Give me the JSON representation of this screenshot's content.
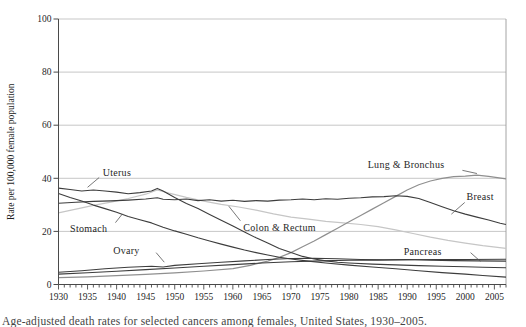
{
  "figure": {
    "caption": "Age-adjusted death rates for selected cancers among females, United States, 1930–2005.",
    "background": "#ffffff"
  },
  "chart_data": {
    "type": "line",
    "title": "",
    "xlabel": "",
    "ylabel": "Rate per 100,000 female population",
    "xlim": [
      1930,
      2007
    ],
    "ylim": [
      0,
      100
    ],
    "x_major_ticks": [
      1930,
      1935,
      1940,
      1945,
      1950,
      1955,
      1960,
      1965,
      1970,
      1975,
      1980,
      1985,
      1990,
      1995,
      2000,
      2005
    ],
    "y_ticks": [
      0,
      20,
      40,
      60,
      80,
      100
    ],
    "grid": "horizontal",
    "legend_position": "inline-annotations",
    "colors": {
      "dark_line": "#3d3d3d",
      "lung_line": "#8f8f8f",
      "colon_line": "#c6c6c6",
      "gridline": "#b9b9b9",
      "axis": "#4a4a4a",
      "text": "#1f1f1f"
    },
    "series": [
      {
        "name": "Colon & Rectum",
        "color": "#c6c6c6",
        "width": 1.2,
        "points": [
          [
            1930,
            27.0
          ],
          [
            1933,
            28.4
          ],
          [
            1936,
            29.8
          ],
          [
            1939,
            31.0
          ],
          [
            1942,
            32.4
          ],
          [
            1945,
            34.0
          ],
          [
            1947,
            35.6
          ],
          [
            1949,
            34.4
          ],
          [
            1952,
            32.8
          ],
          [
            1955,
            31.4
          ],
          [
            1958,
            30.2
          ],
          [
            1961,
            29.2
          ],
          [
            1964,
            28.0
          ],
          [
            1967,
            26.6
          ],
          [
            1970,
            25.4
          ],
          [
            1973,
            24.6
          ],
          [
            1976,
            23.8
          ],
          [
            1979,
            23.2
          ],
          [
            1982,
            22.6
          ],
          [
            1985,
            21.8
          ],
          [
            1988,
            20.6
          ],
          [
            1991,
            19.2
          ],
          [
            1994,
            17.8
          ],
          [
            1997,
            16.6
          ],
          [
            2000,
            15.6
          ],
          [
            2003,
            14.6
          ],
          [
            2007,
            13.6
          ]
        ]
      },
      {
        "name": "Lung & Bronchus",
        "color": "#8f8f8f",
        "width": 1.2,
        "points": [
          [
            1930,
            2.6
          ],
          [
            1935,
            2.9
          ],
          [
            1940,
            3.3
          ],
          [
            1945,
            3.8
          ],
          [
            1950,
            4.4
          ],
          [
            1955,
            5.1
          ],
          [
            1960,
            6.0
          ],
          [
            1963,
            7.2
          ],
          [
            1966,
            8.8
          ],
          [
            1968,
            10.2
          ],
          [
            1970,
            12.0
          ],
          [
            1972,
            14.2
          ],
          [
            1974,
            16.4
          ],
          [
            1976,
            18.8
          ],
          [
            1978,
            21.2
          ],
          [
            1980,
            23.6
          ],
          [
            1982,
            26.0
          ],
          [
            1984,
            28.4
          ],
          [
            1986,
            30.8
          ],
          [
            1988,
            33.2
          ],
          [
            1990,
            35.6
          ],
          [
            1992,
            37.6
          ],
          [
            1994,
            39.0
          ],
          [
            1996,
            40.0
          ],
          [
            1998,
            40.6
          ],
          [
            2000,
            40.8
          ],
          [
            2002,
            41.2
          ],
          [
            2004,
            40.7
          ],
          [
            2007,
            39.8
          ]
        ]
      },
      {
        "name": "Uterus",
        "color": "#3d3d3d",
        "width": 1.1,
        "points": [
          [
            1930,
            36.3
          ],
          [
            1932,
            35.8
          ],
          [
            1934,
            35.2
          ],
          [
            1936,
            35.6
          ],
          [
            1938,
            35.2
          ],
          [
            1940,
            34.8
          ],
          [
            1942,
            34.2
          ],
          [
            1944,
            34.6
          ],
          [
            1946,
            35.2
          ],
          [
            1947,
            36.2
          ],
          [
            1948,
            35.2
          ],
          [
            1950,
            32.8
          ],
          [
            1952,
            30.5
          ],
          [
            1954,
            28.6
          ],
          [
            1956,
            26.4
          ],
          [
            1958,
            24.2
          ],
          [
            1960,
            22.0
          ],
          [
            1962,
            19.8
          ],
          [
            1964,
            17.6
          ],
          [
            1966,
            15.6
          ],
          [
            1968,
            13.6
          ],
          [
            1970,
            12.0
          ],
          [
            1972,
            10.6
          ],
          [
            1974,
            9.6
          ],
          [
            1976,
            8.9
          ],
          [
            1978,
            8.4
          ],
          [
            1980,
            8.1
          ],
          [
            1984,
            7.7
          ],
          [
            1988,
            7.4
          ],
          [
            1992,
            7.1
          ],
          [
            1996,
            6.9
          ],
          [
            2000,
            6.7
          ],
          [
            2003,
            6.5
          ],
          [
            2007,
            6.3
          ]
        ]
      },
      {
        "name": "Stomach",
        "color": "#3d3d3d",
        "width": 1.1,
        "points": [
          [
            1930,
            34.3
          ],
          [
            1932,
            32.8
          ],
          [
            1934,
            31.4
          ],
          [
            1936,
            29.9
          ],
          [
            1938,
            28.6
          ],
          [
            1940,
            27.2
          ],
          [
            1942,
            25.6
          ],
          [
            1944,
            24.4
          ],
          [
            1946,
            23.2
          ],
          [
            1948,
            21.6
          ],
          [
            1950,
            20.2
          ],
          [
            1952,
            18.9
          ],
          [
            1954,
            17.6
          ],
          [
            1956,
            16.4
          ],
          [
            1958,
            15.2
          ],
          [
            1960,
            14.1
          ],
          [
            1962,
            13.0
          ],
          [
            1964,
            12.0
          ],
          [
            1966,
            11.1
          ],
          [
            1968,
            10.3
          ],
          [
            1970,
            9.6
          ],
          [
            1973,
            8.8
          ],
          [
            1976,
            8.1
          ],
          [
            1980,
            7.3
          ],
          [
            1984,
            6.6
          ],
          [
            1988,
            5.9
          ],
          [
            1992,
            5.2
          ],
          [
            1996,
            4.5
          ],
          [
            2000,
            3.9
          ],
          [
            2003,
            3.4
          ],
          [
            2007,
            2.8
          ]
        ]
      },
      {
        "name": "Breast",
        "color": "#3d3d3d",
        "width": 1.1,
        "points": [
          [
            1930,
            30.6
          ],
          [
            1933,
            31.0
          ],
          [
            1936,
            31.3
          ],
          [
            1939,
            31.5
          ],
          [
            1942,
            31.8
          ],
          [
            1945,
            32.2
          ],
          [
            1947,
            32.7
          ],
          [
            1948,
            32.1
          ],
          [
            1950,
            31.9
          ],
          [
            1952,
            32.2
          ],
          [
            1954,
            31.6
          ],
          [
            1956,
            31.9
          ],
          [
            1958,
            31.4
          ],
          [
            1960,
            31.7
          ],
          [
            1962,
            31.3
          ],
          [
            1964,
            31.6
          ],
          [
            1966,
            31.4
          ],
          [
            1968,
            31.8
          ],
          [
            1970,
            31.9
          ],
          [
            1972,
            32.2
          ],
          [
            1974,
            31.9
          ],
          [
            1976,
            32.3
          ],
          [
            1978,
            32.1
          ],
          [
            1980,
            32.5
          ],
          [
            1982,
            32.7
          ],
          [
            1984,
            33.0
          ],
          [
            1986,
            33.1
          ],
          [
            1988,
            33.4
          ],
          [
            1990,
            33.2
          ],
          [
            1992,
            32.4
          ],
          [
            1994,
            30.9
          ],
          [
            1996,
            29.3
          ],
          [
            1998,
            27.8
          ],
          [
            2000,
            26.5
          ],
          [
            2002,
            25.4
          ],
          [
            2004,
            24.3
          ],
          [
            2006,
            23.1
          ],
          [
            2007,
            22.6
          ]
        ]
      },
      {
        "name": "Ovary",
        "color": "#3d3d3d",
        "width": 1.1,
        "points": [
          [
            1930,
            4.6
          ],
          [
            1934,
            5.2
          ],
          [
            1938,
            5.9
          ],
          [
            1942,
            6.5
          ],
          [
            1946,
            6.9
          ],
          [
            1948,
            6.6
          ],
          [
            1950,
            7.2
          ],
          [
            1954,
            7.8
          ],
          [
            1958,
            8.4
          ],
          [
            1962,
            8.9
          ],
          [
            1966,
            9.4
          ],
          [
            1970,
            9.8
          ],
          [
            1974,
            9.9
          ],
          [
            1978,
            9.7
          ],
          [
            1982,
            9.4
          ],
          [
            1986,
            9.3
          ],
          [
            1990,
            9.4
          ],
          [
            1994,
            9.2
          ],
          [
            1998,
            9.0
          ],
          [
            2002,
            8.9
          ],
          [
            2007,
            8.8
          ]
        ]
      },
      {
        "name": "Pancreas",
        "color": "#3d3d3d",
        "width": 1.1,
        "points": [
          [
            1930,
            3.9
          ],
          [
            1935,
            4.4
          ],
          [
            1940,
            5.0
          ],
          [
            1945,
            5.6
          ],
          [
            1950,
            6.2
          ],
          [
            1955,
            6.9
          ],
          [
            1960,
            7.5
          ],
          [
            1965,
            8.1
          ],
          [
            1970,
            8.6
          ],
          [
            1975,
            8.9
          ],
          [
            1980,
            9.1
          ],
          [
            1985,
            9.2
          ],
          [
            1990,
            9.3
          ],
          [
            1995,
            9.4
          ],
          [
            2000,
            9.4
          ],
          [
            2007,
            9.5
          ]
        ]
      }
    ],
    "annotations": [
      {
        "label": "Uterus",
        "x": 1937.6,
        "y": 41.0,
        "leader": [
          [
            1937.0,
            40.3
          ],
          [
            1935.0,
            36.6
          ]
        ]
      },
      {
        "label": "Stomach",
        "x": 1932.0,
        "y": 19.9,
        "leader": [
          [
            1939.8,
            23.3
          ],
          [
            1941.0,
            26.6
          ]
        ]
      },
      {
        "label": "Ovary",
        "x": 1939.4,
        "y": 11.6,
        "leader": [
          [
            1946.8,
            12.0
          ],
          [
            1948.2,
            8.4
          ]
        ]
      },
      {
        "label": "Colon & Rectum",
        "x": 1961.8,
        "y": 20.3,
        "leader": [
          [
            1961.3,
            24.0
          ],
          [
            1959.3,
            29.5
          ]
        ]
      },
      {
        "label": "Pancreas",
        "x": 1989.4,
        "y": 11.2,
        "leader": [
          [
            2000.9,
            12.0
          ],
          [
            2002.6,
            8.7
          ]
        ]
      },
      {
        "label": "Lung & Bronchus",
        "x": 1983.2,
        "y": 44.0,
        "leader": [
          [
            1999.5,
            43.0
          ],
          [
            2002.0,
            41.8
          ]
        ]
      },
      {
        "label": "Breast",
        "x": 2000.2,
        "y": 32.0,
        "leader": [
          [
            1999.9,
            30.9
          ],
          [
            1997.6,
            26.5
          ]
        ]
      }
    ]
  }
}
